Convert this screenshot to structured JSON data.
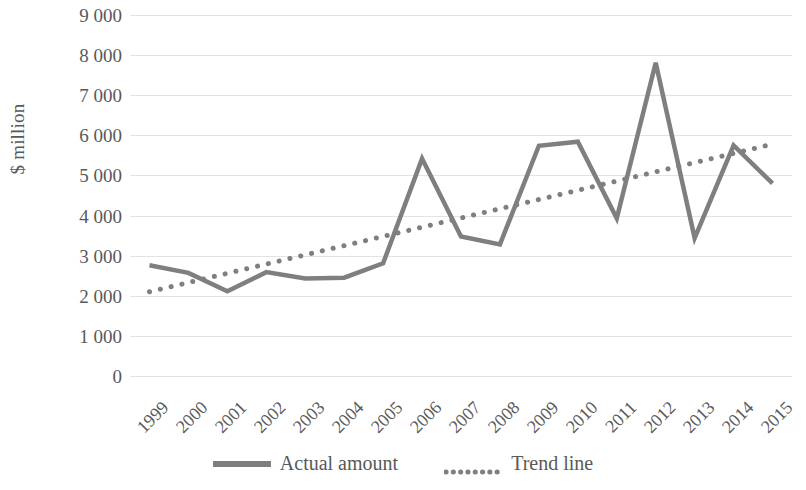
{
  "chart_data": {
    "type": "line",
    "title": "",
    "xlabel": "",
    "ylabel": "$ million",
    "ylim": [
      0,
      9000
    ],
    "ytick_step": 1000,
    "grid": true,
    "legend_position": "bottom",
    "categories": [
      "1999",
      "2000",
      "2001",
      "2002",
      "2003",
      "2004",
      "2005",
      "2006",
      "2007",
      "2008",
      "2009",
      "2010",
      "2011",
      "2012",
      "2013",
      "2014",
      "2015"
    ],
    "ytick_labels": [
      "9 000",
      "8 000",
      "7 000",
      "6 000",
      "5 000",
      "4 000",
      "3 000",
      "2 000",
      "1 000",
      "0"
    ],
    "ytick_values": [
      9000,
      8000,
      7000,
      6000,
      5000,
      4000,
      3000,
      2000,
      1000,
      0
    ],
    "series": [
      {
        "name": "Actual amount",
        "style": "solid",
        "color": "#7f7f7f",
        "values": [
          2760,
          2570,
          2110,
          2590,
          2430,
          2450,
          2810,
          5420,
          3480,
          3280,
          5740,
          5840,
          3930,
          7810,
          3440,
          5750,
          4800
        ]
      },
      {
        "name": "Trend line",
        "style": "dotted",
        "color": "#7f7f7f",
        "values": [
          2100,
          2330,
          2560,
          2790,
          3020,
          3250,
          3480,
          3710,
          3940,
          4170,
          4400,
          4630,
          4860,
          5090,
          5320,
          5550,
          5780
        ]
      }
    ]
  },
  "legend": {
    "entries": [
      {
        "label": "Actual amount",
        "marker": "solid-line-swatch"
      },
      {
        "label": "Trend line",
        "marker": "dotted-line-swatch"
      }
    ]
  },
  "colors": {
    "line": "#7f7f7f",
    "grid": "#e3e3e3",
    "text": "#595959",
    "background": "#ffffff"
  }
}
